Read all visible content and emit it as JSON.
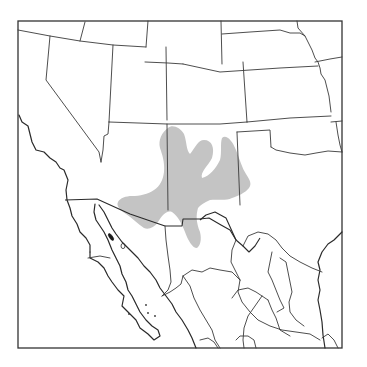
{
  "map": {
    "type": "species-range-map",
    "region": "Southwestern United States and Northern Mexico",
    "colors": {
      "background": "#ffffff",
      "borders": "#3a3a3a",
      "range_fill": "#c4c4c4"
    },
    "layers": {
      "frame": "map-frame",
      "state_borders": "us-state-and-mexican-state-boundaries",
      "international_border": "us-mexico-border",
      "coastline": "pacific-and-gulf-of-california-coastline",
      "range": "shaded-distribution-range"
    },
    "range_description": "Gray shaded distribution covering eastern New Mexico, western Texas, the Oklahoma/Texas panhandle edge, southeastern Arizona, and northern Chihuahua"
  }
}
